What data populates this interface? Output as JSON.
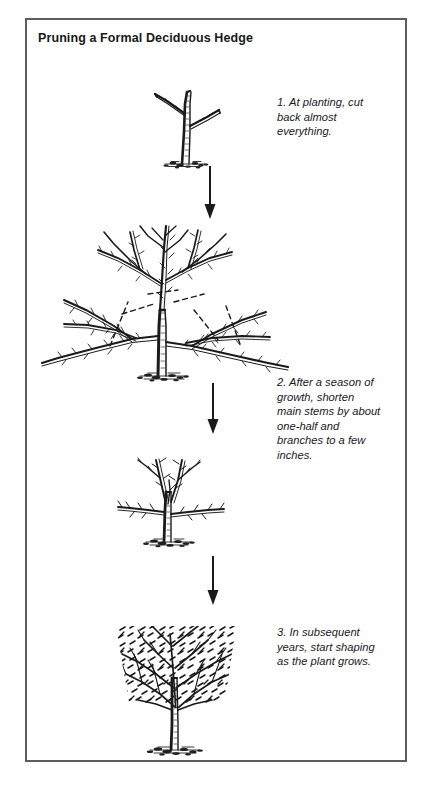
{
  "figure": {
    "title": "Pruning a Formal Deciduous Hedge",
    "border_color": "#5a5c5e",
    "ink_color": "#1a1a1a",
    "background": "#ffffff"
  },
  "steps": [
    {
      "number": "1",
      "caption": "1. At planting, cut\nback almost\neverything.",
      "illustration": "young-stub-plant"
    },
    {
      "number": "2",
      "caption": "2. After a season of\ngrowth, shorten\nmain stems by about\none-half and\nbranches to a few\ninches.",
      "illustration": "branched-plant-with-cut-lines"
    },
    {
      "number": "3",
      "caption": "3. In subsequent\nyears, start shaping\nas the plant grows.",
      "illustration": "shaped-hedge-plant"
    }
  ],
  "illustrations": [
    {
      "name": "stage-1-plant",
      "label": "newly planted stub with two short branches"
    },
    {
      "name": "stage-2-plant",
      "label": "plant after a season of growth with dashed pruning cut lines"
    },
    {
      "name": "stage-3-plant",
      "label": "plant shortened back to short branches"
    },
    {
      "name": "stage-4-plant",
      "label": "dense formal hedge sheared to a flat-topped shape"
    }
  ],
  "arrows": [
    {
      "name": "arrow-1",
      "direction": "down"
    },
    {
      "name": "arrow-2",
      "direction": "down"
    },
    {
      "name": "arrow-3",
      "direction": "down"
    }
  ]
}
